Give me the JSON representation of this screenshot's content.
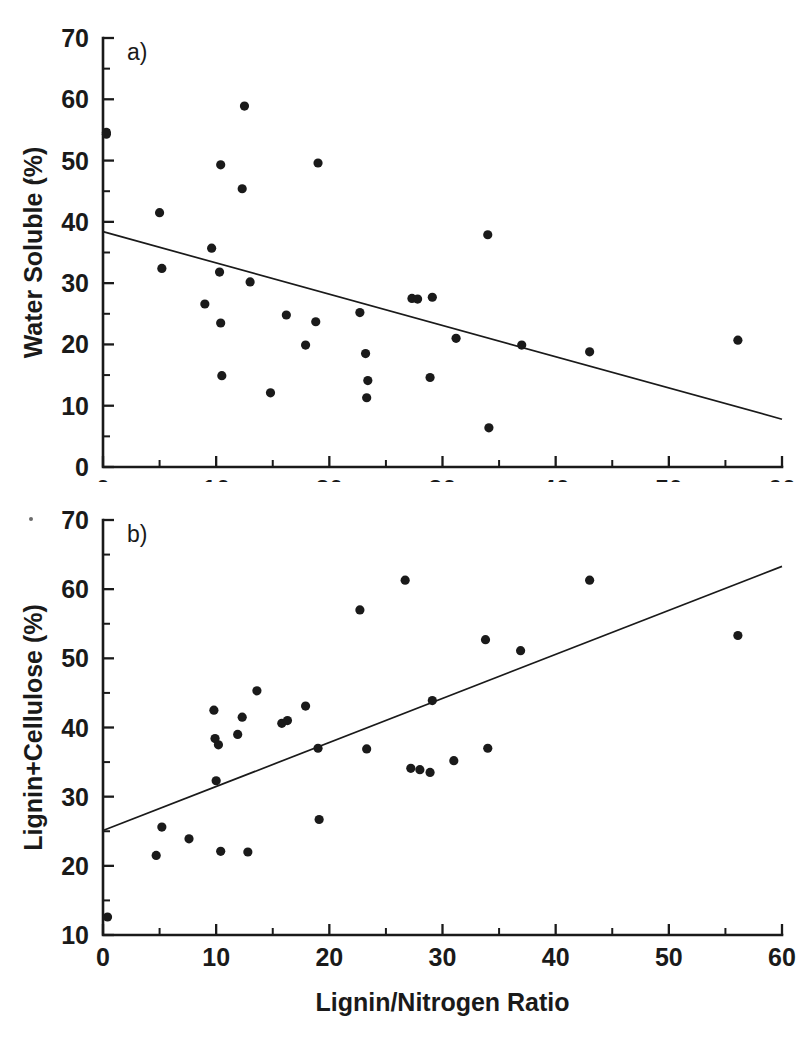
{
  "figure": {
    "xlabel": "Lignin/Nitrogen Ratio",
    "panel_a_tag": "a)",
    "panel_b_tag": "b)",
    "panel_a_ylabel": "Water Soluble (%)",
    "panel_b_ylabel": "Lignin+Cellulose (%)",
    "ink_color": "#1a1a1a",
    "background_color": "#ffffff"
  },
  "chart_data": [
    {
      "type": "scatter",
      "panel": "a)",
      "title": "",
      "xlabel": "Lignin/Nitrogen Ratio",
      "ylabel": "Water Soluble (%)",
      "xlim": [
        0,
        60
      ],
      "ylim": [
        0,
        70
      ],
      "xticks": [
        0,
        10,
        20,
        30,
        40,
        50,
        60
      ],
      "xtick_labels": [
        "0",
        "10",
        "20",
        "30",
        "40",
        "50",
        "60"
      ],
      "xminor_step": 5,
      "yticks": [
        0,
        10,
        20,
        30,
        40,
        50,
        60,
        70
      ],
      "ytick_labels": [
        "0",
        "10",
        "20",
        "30",
        "40",
        "50",
        "60",
        "70"
      ],
      "yminor_step": 5,
      "grid": false,
      "legend": "none",
      "points": [
        [
          0.3,
          54.6
        ],
        [
          0.3,
          54.3
        ],
        [
          5.0,
          41.5
        ],
        [
          5.2,
          32.4
        ],
        [
          9.0,
          26.6
        ],
        [
          9.6,
          35.7
        ],
        [
          10.3,
          31.8
        ],
        [
          10.4,
          49.3
        ],
        [
          10.4,
          23.5
        ],
        [
          10.5,
          14.9
        ],
        [
          12.3,
          45.4
        ],
        [
          12.5,
          58.9
        ],
        [
          13.0,
          30.2
        ],
        [
          14.8,
          12.1
        ],
        [
          16.2,
          24.8
        ],
        [
          17.9,
          19.9
        ],
        [
          18.8,
          23.7
        ],
        [
          19.0,
          49.6
        ],
        [
          22.7,
          25.2
        ],
        [
          23.2,
          18.5
        ],
        [
          23.3,
          11.3
        ],
        [
          23.4,
          14.1
        ],
        [
          27.3,
          27.5
        ],
        [
          27.8,
          27.4
        ],
        [
          28.9,
          14.6
        ],
        [
          29.1,
          27.7
        ],
        [
          31.2,
          21.0
        ],
        [
          34.0,
          37.9
        ],
        [
          34.1,
          6.4
        ],
        [
          37.0,
          19.9
        ],
        [
          43.0,
          18.8
        ],
        [
          56.1,
          20.7
        ]
      ],
      "fit_line": {
        "x1": 0,
        "y1": 38.4,
        "x2": 60,
        "y2": 7.8,
        "label": "linear regression"
      }
    },
    {
      "type": "scatter",
      "panel": "b)",
      "title": "",
      "xlabel": "Lignin/Nitrogen Ratio",
      "ylabel": "Lignin+Cellulose (%)",
      "xlim": [
        0,
        60
      ],
      "ylim": [
        10,
        70
      ],
      "xticks": [
        0,
        10,
        20,
        30,
        40,
        50,
        60
      ],
      "xtick_labels": [
        "0",
        "10",
        "20",
        "30",
        "40",
        "50",
        "60"
      ],
      "xminor_step": 5,
      "yticks": [
        10,
        20,
        30,
        40,
        50,
        60,
        70
      ],
      "ytick_labels": [
        "10",
        "20",
        "30",
        "40",
        "50",
        "60",
        "70"
      ],
      "yminor_step": 5,
      "grid": false,
      "legend": "none",
      "points": [
        [
          0.4,
          12.6
        ],
        [
          4.7,
          21.5
        ],
        [
          5.2,
          25.6
        ],
        [
          7.6,
          23.9
        ],
        [
          9.8,
          42.5
        ],
        [
          9.9,
          38.4
        ],
        [
          10.0,
          32.3
        ],
        [
          10.2,
          37.5
        ],
        [
          10.4,
          22.1
        ],
        [
          11.9,
          39.0
        ],
        [
          12.3,
          41.5
        ],
        [
          12.8,
          22.0
        ],
        [
          13.6,
          45.3
        ],
        [
          15.8,
          40.6
        ],
        [
          16.3,
          41.0
        ],
        [
          17.9,
          43.1
        ],
        [
          19.0,
          37.0
        ],
        [
          19.1,
          26.7
        ],
        [
          22.7,
          57.0
        ],
        [
          23.3,
          36.9
        ],
        [
          26.7,
          61.3
        ],
        [
          27.2,
          34.1
        ],
        [
          28.0,
          33.9
        ],
        [
          28.9,
          33.5
        ],
        [
          29.1,
          43.9
        ],
        [
          31.0,
          35.2
        ],
        [
          33.8,
          52.7
        ],
        [
          34.0,
          37.0
        ],
        [
          36.9,
          51.1
        ],
        [
          43.0,
          61.3
        ],
        [
          56.1,
          53.3
        ]
      ],
      "fit_line": {
        "x1": 0,
        "y1": 25.1,
        "x2": 60,
        "y2": 63.3,
        "label": "linear regression"
      }
    }
  ],
  "render": {
    "panel_width": 812,
    "panel_height": 482,
    "plot_left": 103,
    "plot_right": 782,
    "panel_a_top": 38,
    "panel_a_bottom": 467,
    "panel_b_top": 38,
    "panel_b_bottom": 453,
    "point_radius": 4.6,
    "tick_major_len": 11,
    "tick_minor_len": 7
  }
}
